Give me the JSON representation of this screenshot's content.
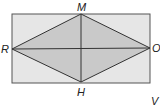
{
  "diagram": {
    "type": "geometry",
    "colors": {
      "rectangle_fill": "#e6e6e6",
      "rhombus_fill": "#c9c9c9",
      "stroke": "#333333"
    },
    "labels": {
      "M": "M",
      "H": "H",
      "R": "R",
      "O": "O",
      "V": "V"
    }
  }
}
